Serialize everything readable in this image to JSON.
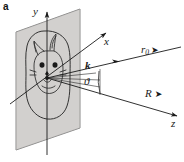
{
  "figure": {
    "panel_label": "a",
    "type": "scattering-geometry-schematic",
    "background_color": "#ffffff",
    "ink_color": "#1a1a1a",
    "plane_fill_color": "#d4d2d0",
    "plane_edge_color": "#6b6b6b"
  },
  "labels": {
    "panel": "a",
    "y_axis": "y",
    "x_axis": "x",
    "z_axis": "z",
    "wave_vector": "k",
    "angle": "ϑ",
    "r_zero_base": "r",
    "r_zero_sub": "0",
    "big_r": "R",
    "arrow_glyph": "➤"
  },
  "elements": {
    "plane_name": "object-plane",
    "blob_name": "object-outline",
    "face_name": "cat-face-sketch",
    "origin_name": "origin-point",
    "angle_arc_name": "angle-arc",
    "ray_bundle_name": "scattered-ray-bundle"
  },
  "geometry": {
    "origin_x": 47,
    "origin_y": 78,
    "plane_top_left_x": 17,
    "plane_top_y": 18,
    "plane_bottom_y": 150,
    "k_ray_arrowhead_x": 118,
    "z_axis_end_x": 178,
    "x_axis_end_x": 107
  }
}
